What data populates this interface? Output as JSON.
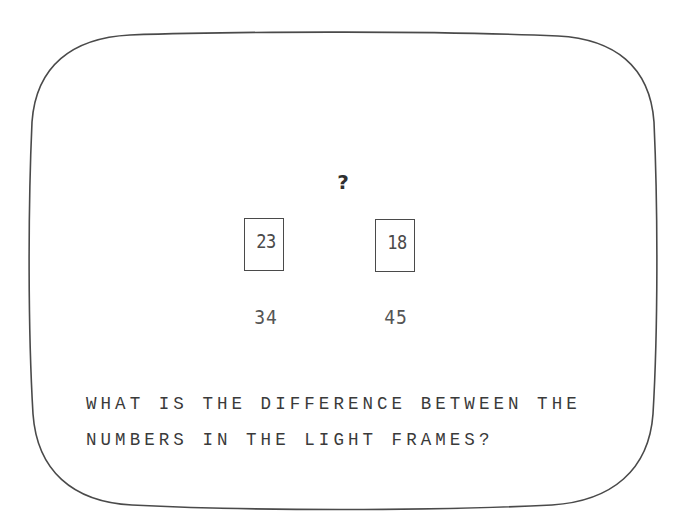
{
  "screen": {
    "device": "crt-monitor",
    "background_color": "#ffffff",
    "outline_color": "#4a4a4a",
    "text_color": "#3a3a3a"
  },
  "puzzle": {
    "question_marker": "?",
    "frames": [
      {
        "position": "left",
        "framed_value": "23",
        "under_value": "34"
      },
      {
        "position": "right",
        "framed_value": "18",
        "under_value": "45"
      }
    ],
    "prompt_lines": [
      "WHAT IS THE DIFFERENCE BETWEEN THE",
      "NUMBERS IN THE LIGHT FRAMES?"
    ]
  }
}
